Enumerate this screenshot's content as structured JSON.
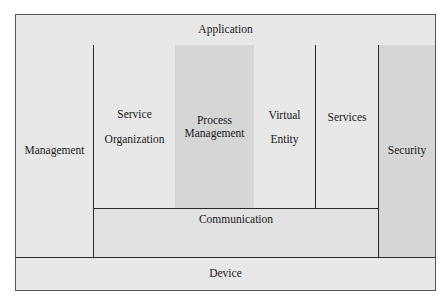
{
  "diagram": {
    "layers": {
      "application": "Application",
      "device": "Device",
      "communication": "Communication",
      "management": "Management",
      "security": "Security",
      "service_organization": [
        "Service",
        "Organization"
      ],
      "process_management": [
        "Process",
        "Management"
      ],
      "virtual_entity": [
        "Virtual",
        "Entity"
      ],
      "services": "Services"
    },
    "colors": {
      "light": "#e8e8e8",
      "dark": "#d6d6d6",
      "border": "#2a2a2a"
    }
  }
}
